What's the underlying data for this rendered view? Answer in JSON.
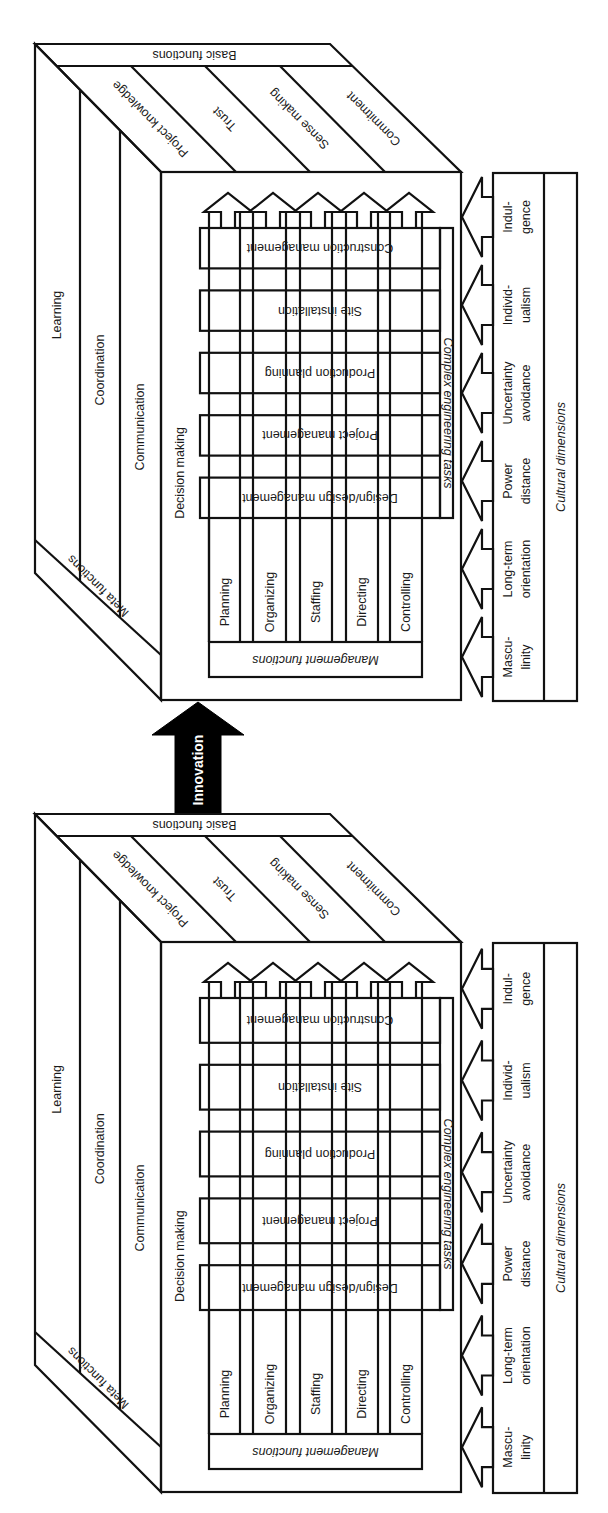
{
  "diagram": {
    "transition_arrow": {
      "label": "Innovation",
      "color": "#000000",
      "text_color": "#ffffff"
    },
    "cubes": [
      {
        "id": "after",
        "position": "top",
        "fill": "#d2d2d2",
        "meta_functions": {
          "title": "Meta functions",
          "items": [
            "Learning",
            "Coordination",
            "Communication",
            "Decision making"
          ]
        },
        "basic_functions": {
          "title": "Basic functions",
          "items": [
            "Project knowledge",
            "Trust",
            "Sense making",
            "Commitment"
          ]
        },
        "management_functions": {
          "title": "Management functions",
          "items": [
            "Planning",
            "Organizing",
            "Staffing",
            "Directing",
            "Controlling"
          ]
        },
        "complex_engineering_tasks": {
          "title": "Complex engineering tasks",
          "items": [
            "Design/design management",
            "Project management",
            "Production planning",
            "Site installation",
            "Construction management"
          ]
        },
        "cultural_dimensions": {
          "title": "Cultural dimensions",
          "items": [
            [
              "Mascu-",
              "linity"
            ],
            [
              "Long-term",
              "orientation"
            ],
            [
              "Power",
              "distance"
            ],
            [
              "Uncertainty",
              "avoidance"
            ],
            [
              "Individ-",
              "ualism"
            ],
            [
              "Indul-",
              "gence"
            ]
          ]
        }
      },
      {
        "id": "before",
        "position": "bottom",
        "fill": "#ffffff",
        "meta_functions": {
          "title": "Meta functions",
          "items": [
            "Learning",
            "Coordination",
            "Communication",
            "Decision making"
          ]
        },
        "basic_functions": {
          "title": "Basic functions",
          "items": [
            "Project knowledge",
            "Trust",
            "Sense making",
            "Commitment"
          ]
        },
        "management_functions": {
          "title": "Management functions",
          "items": [
            "Planning",
            "Organizing",
            "Staffing",
            "Directing",
            "Controlling"
          ]
        },
        "complex_engineering_tasks": {
          "title": "Complex engineering tasks",
          "items": [
            "Design/design management",
            "Project management",
            "Production planning",
            "Site installation",
            "Construction management"
          ]
        },
        "cultural_dimensions": {
          "title": "Cultural dimensions",
          "items": [
            [
              "Mascu-",
              "linity"
            ],
            [
              "Long-term",
              "orientation"
            ],
            [
              "Power",
              "distance"
            ],
            [
              "Uncertainty",
              "avoidance"
            ],
            [
              "Individ-",
              "ualism"
            ],
            [
              "Indul-",
              "gence"
            ]
          ]
        }
      }
    ]
  }
}
